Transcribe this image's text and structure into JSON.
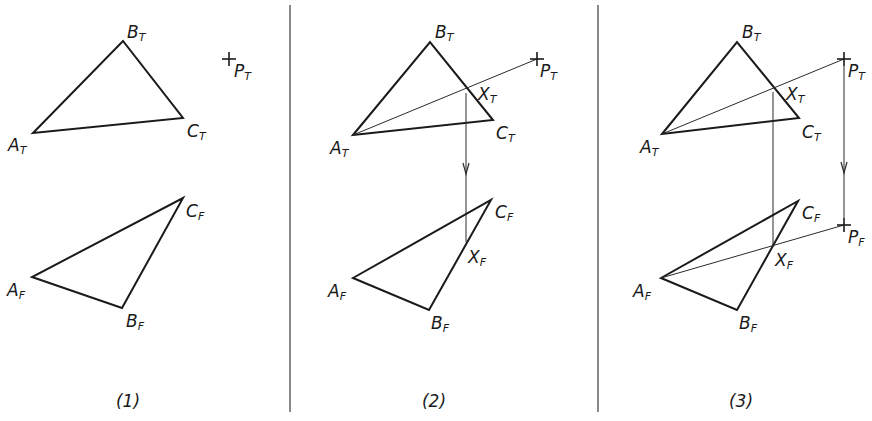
{
  "figure": {
    "panels": [
      {
        "caption": "(1)",
        "top_view": {
          "A": {
            "label": "A",
            "sub": "T"
          },
          "B": {
            "label": "B",
            "sub": "T"
          },
          "C": {
            "label": "C",
            "sub": "T"
          },
          "P": {
            "label": "P",
            "sub": "T"
          }
        },
        "front_view": {
          "A": {
            "label": "A",
            "sub": "F"
          },
          "B": {
            "label": "B",
            "sub": "F"
          },
          "C": {
            "label": "C",
            "sub": "F"
          }
        }
      },
      {
        "caption": "(2)",
        "top_view": {
          "A": {
            "label": "A",
            "sub": "T"
          },
          "B": {
            "label": "B",
            "sub": "T"
          },
          "C": {
            "label": "C",
            "sub": "T"
          },
          "P": {
            "label": "P",
            "sub": "T"
          },
          "X": {
            "label": "X",
            "sub": "T"
          }
        },
        "front_view": {
          "A": {
            "label": "A",
            "sub": "F"
          },
          "B": {
            "label": "B",
            "sub": "F"
          },
          "C": {
            "label": "C",
            "sub": "F"
          },
          "X": {
            "label": "X",
            "sub": "F"
          }
        }
      },
      {
        "caption": "(3)",
        "top_view": {
          "A": {
            "label": "A",
            "sub": "T"
          },
          "B": {
            "label": "B",
            "sub": "T"
          },
          "C": {
            "label": "C",
            "sub": "T"
          },
          "P": {
            "label": "P",
            "sub": "T"
          },
          "X": {
            "label": "X",
            "sub": "T"
          }
        },
        "front_view": {
          "A": {
            "label": "A",
            "sub": "F"
          },
          "B": {
            "label": "B",
            "sub": "F"
          },
          "C": {
            "label": "C",
            "sub": "F"
          },
          "X": {
            "label": "X",
            "sub": "F"
          },
          "P": {
            "label": "P",
            "sub": "F"
          }
        }
      }
    ]
  }
}
